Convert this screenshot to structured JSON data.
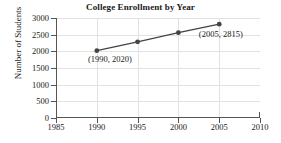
{
  "chart_data": {
    "type": "line",
    "title": "College Enrollment by Year",
    "xlabel": "",
    "ylabel": "Number of Students",
    "x": [
      1990,
      1995,
      2000,
      2005
    ],
    "values": [
      2020,
      2285,
      2560,
      2815
    ],
    "series": [
      {
        "name": "Enrollment",
        "x": [
          1990,
          1995,
          2000,
          2005
        ],
        "values": [
          2020,
          2285,
          2560,
          2815
        ],
        "color": "#444444",
        "marker": "circle"
      }
    ],
    "xlim": [
      1985,
      2010
    ],
    "ylim": [
      0,
      3000
    ],
    "xticks": [
      1985,
      1990,
      1995,
      2000,
      2005,
      2010
    ],
    "yticks": [
      0,
      500,
      1000,
      1500,
      2000,
      2500,
      3000
    ],
    "xtick_labels": [
      "1985",
      "1990",
      "1995",
      "2000",
      "2005",
      "2010"
    ],
    "ytick_labels": [
      "0",
      "500",
      "1000",
      "1500",
      "2000",
      "2500",
      "3000"
    ],
    "grid": true,
    "legend": false,
    "annotations": [
      {
        "text": "(1990, 2020)",
        "point_x": 1990,
        "point_y": 2020,
        "label_x": 1991.6,
        "label_y": 1760
      },
      {
        "text": "(2005, 2815)",
        "point_x": 2005,
        "point_y": 2815,
        "label_x": 2005.2,
        "label_y": 2510
      }
    ],
    "colors": {
      "line": "#444444",
      "marker": "#444444",
      "axis": "#555555",
      "grid": "#e2e2e2",
      "text": "#1a1a1a",
      "background": "#ffffff"
    }
  }
}
